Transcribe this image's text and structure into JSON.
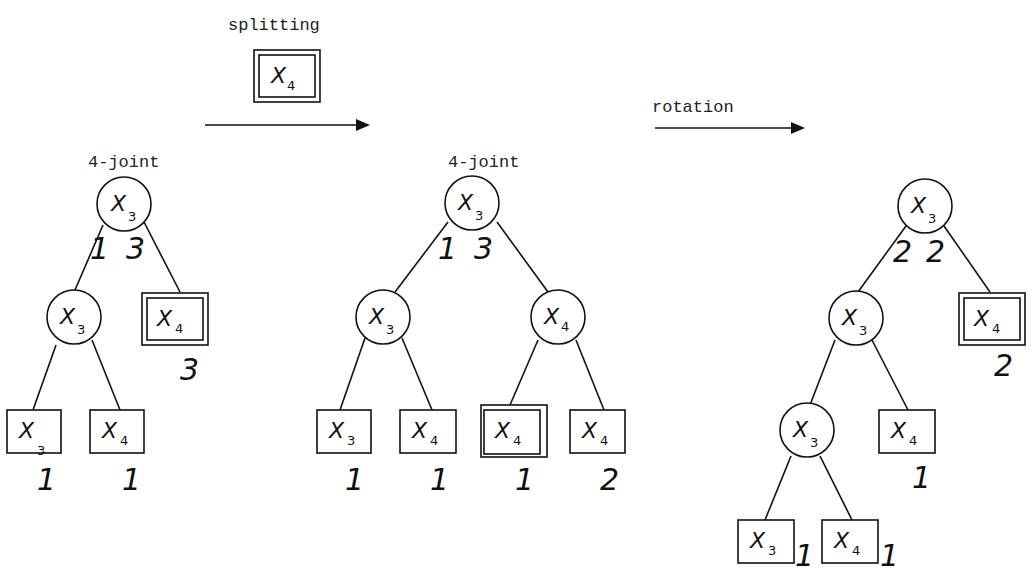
{
  "labels": {
    "splitting": "splitting",
    "rotation": "rotation",
    "joint_left": "4-joint",
    "joint_middle": "4-joint"
  },
  "split_item": {
    "var": "X",
    "sub": "4",
    "double": true
  },
  "tree1": {
    "root": {
      "var": "X",
      "sub": "3",
      "w_left": "1",
      "w_right": "3"
    },
    "left": {
      "var": "X",
      "sub": "3"
    },
    "right_leaf": {
      "var": "X",
      "sub": "4",
      "double": true,
      "count": "3"
    },
    "ll_leaf": {
      "var": "X",
      "sub": "3",
      "count": "1"
    },
    "lr_leaf": {
      "var": "X",
      "sub": "4",
      "count": "1"
    }
  },
  "tree2": {
    "root": {
      "var": "X",
      "sub": "3",
      "w_left": "1",
      "w_right": "3"
    },
    "left": {
      "var": "X",
      "sub": "3"
    },
    "right": {
      "var": "X",
      "sub": "4"
    },
    "ll_leaf": {
      "var": "X",
      "sub": "3",
      "count": "1"
    },
    "lr_leaf": {
      "var": "X",
      "sub": "4",
      "count": "1"
    },
    "rl_leaf": {
      "var": "X",
      "sub": "4",
      "double": true,
      "count": "1"
    },
    "rr_leaf": {
      "var": "X",
      "sub": "4",
      "count": "2"
    }
  },
  "tree3": {
    "root": {
      "var": "X",
      "sub": "3",
      "w_left": "2",
      "w_right": "2"
    },
    "left": {
      "var": "X",
      "sub": "3"
    },
    "right_leaf": {
      "var": "X",
      "sub": "4",
      "double": true,
      "count": "2"
    },
    "ll": {
      "var": "X",
      "sub": "3"
    },
    "lr_leaf": {
      "var": "X",
      "sub": "4",
      "count": "1"
    },
    "lll_leaf": {
      "var": "X",
      "sub": "3",
      "count": "1"
    },
    "llr_leaf": {
      "var": "X",
      "sub": "4",
      "count": "1"
    }
  }
}
